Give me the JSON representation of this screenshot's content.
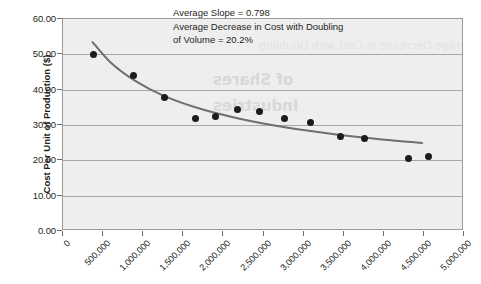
{
  "chart_data": {
    "type": "scatter",
    "title": "",
    "xlabel": "",
    "ylabel": "Cost Per Unit of Production ($)",
    "xlim": [
      0,
      5000000
    ],
    "ylim": [
      0,
      60
    ],
    "grid": true,
    "legend": "none",
    "x_tick_labels": [
      "0",
      "500,000",
      "1,000,000",
      "1,500,000",
      "2,000,000",
      "2,500,000",
      "3,000,000",
      "3,500,000",
      "4,000,000",
      "4,500,000",
      "5,000,000"
    ],
    "x_ticks": [
      0,
      500000,
      1000000,
      1500000,
      2000000,
      2500000,
      3000000,
      3500000,
      4000000,
      4500000,
      5000000
    ],
    "y_tick_labels": [
      "0.00",
      "10.00",
      "20.00",
      "30.00",
      "40.00",
      "50.00",
      "60.00"
    ],
    "y_ticks": [
      0,
      10,
      20,
      30,
      40,
      50,
      60
    ],
    "series": [
      {
        "name": "Cost Per Unit of Production",
        "marker": "circle",
        "color": "#1b1b1b",
        "points": [
          {
            "x": 380000,
            "y": 49.9
          },
          {
            "x": 880000,
            "y": 43.9
          },
          {
            "x": 1260000,
            "y": 37.9
          },
          {
            "x": 1650000,
            "y": 31.8
          },
          {
            "x": 1900000,
            "y": 32.5
          },
          {
            "x": 2180000,
            "y": 34.3
          },
          {
            "x": 2450000,
            "y": 33.7
          },
          {
            "x": 2760000,
            "y": 31.8
          },
          {
            "x": 3080000,
            "y": 30.7
          },
          {
            "x": 3460000,
            "y": 26.8
          },
          {
            "x": 3760000,
            "y": 26.1
          },
          {
            "x": 4310000,
            "y": 20.4
          },
          {
            "x": 4560000,
            "y": 21.2
          }
        ]
      }
    ],
    "trendline": {
      "name": "Power fit",
      "color": "#6e6e6e",
      "points": [
        {
          "x": 370000,
          "y": 53.4
        },
        {
          "x": 600000,
          "y": 47.5
        },
        {
          "x": 900000,
          "y": 42.4
        },
        {
          "x": 1250000,
          "y": 38.2
        },
        {
          "x": 1700000,
          "y": 34.5
        },
        {
          "x": 2200000,
          "y": 31.6
        },
        {
          "x": 2800000,
          "y": 29.0
        },
        {
          "x": 3400000,
          "y": 27.1
        },
        {
          "x": 4000000,
          "y": 25.6
        },
        {
          "x": 4500000,
          "y": 24.6
        }
      ]
    },
    "annotations": [
      "Average Slope = 0.798",
      "Average Decrease in Cost with Doubling",
      "of Volume = 20.2%"
    ]
  },
  "annotation": {
    "line1": "Average Slope = 0.798",
    "line2": "Average Decrease in Cost with Doubling",
    "line3": "of Volume = 20.2%"
  },
  "axes": {
    "y_title": "Cost Per Unit of Production ($)"
  },
  "background_bleed": {
    "line1": "of Shares",
    "line2": "Industries",
    "line3": "Average Decrease in Cost with Doubling"
  },
  "colors": {
    "plot_background": "#eeeeee",
    "gridline": "#a8a8a8",
    "marker": "#1b1b1b",
    "trendline": "#6e6e6e",
    "text": "#231f20",
    "page_background": "#ffffff"
  }
}
